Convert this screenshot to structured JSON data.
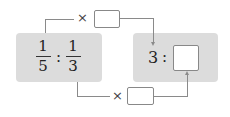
{
  "diagram": {
    "left_ratio": {
      "first": {
        "numerator": "1",
        "denominator": "5"
      },
      "separator": ":",
      "second": {
        "numerator": "1",
        "denominator": "3"
      }
    },
    "right_ratio": {
      "first": "3",
      "separator": ":",
      "second_blank": ""
    },
    "top_operation": {
      "operator": "×",
      "blank": ""
    },
    "bottom_operation": {
      "operator": "×",
      "blank": ""
    },
    "colors": {
      "panel": "#dcdcdc",
      "lines": "#8a8a8a",
      "text": "#222222"
    }
  }
}
